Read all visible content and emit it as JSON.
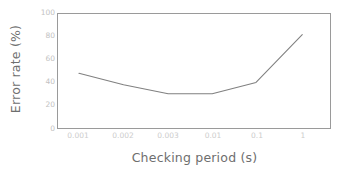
{
  "chart_data": {
    "type": "line",
    "title": "",
    "subtitle": "",
    "xlabel": "Checking period (s)",
    "ylabel": "Error rate (%)",
    "x_tick_labels": [
      "0.001",
      "0.002",
      "0.003",
      "0.01",
      "0.1",
      "1"
    ],
    "y_tick_labels": [
      "0",
      "20",
      "40",
      "60",
      "80",
      "100"
    ],
    "y_tick_values": [
      0,
      20,
      40,
      60,
      80,
      100
    ],
    "ylim": [
      0,
      100
    ],
    "x_scale": "categorical-log",
    "grid": false,
    "legend": null,
    "categories": [
      "0.001",
      "0.002",
      "0.003",
      "0.01",
      "0.1",
      "1"
    ],
    "values": [
      48,
      38,
      30,
      30,
      40,
      82
    ],
    "series": [
      {
        "name": "Error rate",
        "values": [
          48,
          38,
          30,
          30,
          40,
          82
        ]
      }
    ],
    "line_color": "#808080",
    "frame_color": "#9a9a9a",
    "tick_label_color": "#c6c6c6",
    "axis_title_color": "#6e6e6e",
    "background_color": "#ffffff"
  }
}
